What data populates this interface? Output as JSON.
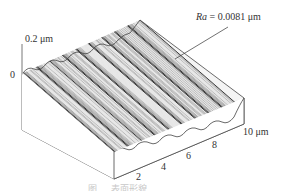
{
  "chart_data": {
    "type": "surface3d",
    "title": "",
    "annotation": {
      "symbol": "Ra",
      "text": " = 0.0081 μm",
      "value": 0.0081,
      "unit": "μm"
    },
    "z_axis": {
      "label_top": "0.2 μm",
      "label_bottom": "0",
      "range": [
        0,
        0.2
      ],
      "unit": "μm"
    },
    "x_axis": {
      "tick_labels": [
        "2",
        "4",
        "6",
        "8",
        "10 μm"
      ],
      "ticks": [
        2,
        4,
        6,
        8,
        10
      ],
      "range": [
        0,
        10
      ],
      "unit": "μm"
    },
    "y_axis": {
      "tick_labels": [],
      "ticks_count": 5,
      "range": [
        0,
        10
      ],
      "unit": "μm"
    },
    "surface": {
      "description": "Periodic parallel grooves (wavy ridges) running diagonally across a 10 μm × 10 μm area",
      "groove_count": 9,
      "colors": {
        "line": "#333333",
        "fill": "#ffffff",
        "axis": "#555555"
      }
    },
    "grid": false,
    "legend": null,
    "caption": "图 … 表面形貌"
  }
}
